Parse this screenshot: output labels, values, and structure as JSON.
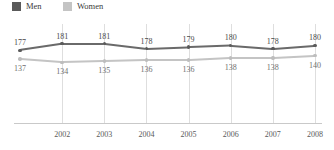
{
  "legend": {
    "items": [
      {
        "label": "Men",
        "color": "#5a5a5a",
        "swatch_name": "legend-swatch-men"
      },
      {
        "label": "Women",
        "color": "#c4c4c4",
        "swatch_name": "legend-swatch-women"
      }
    ]
  },
  "axis": {
    "tick_labels": [
      "2002",
      "2003",
      "2004",
      "2005",
      "2006",
      "2007",
      "2008"
    ],
    "line_color": "#c9c9c9",
    "grid_color": "#dedede"
  },
  "chart_data": {
    "type": "line",
    "title": "",
    "subtitle": "",
    "xlabel": "",
    "ylabel": "",
    "grid": true,
    "legend_position": "top-left",
    "categories": [
      "",
      "2002",
      "2003",
      "2004",
      "2005",
      "2006",
      "2007",
      "2008"
    ],
    "x_tick_labels": [
      "2002",
      "2003",
      "2004",
      "2005",
      "2006",
      "2007",
      "2008"
    ],
    "series": [
      {
        "name": "Men",
        "color": "#5a5a5a",
        "label_position": "above",
        "values": [
          177,
          181,
          181,
          178,
          179,
          180,
          178,
          180
        ]
      },
      {
        "name": "Women",
        "color": "#c4c4c4",
        "label_position": "below",
        "values": [
          137,
          134,
          135,
          136,
          136,
          138,
          138,
          140
        ]
      }
    ],
    "men_labels": [
      "177",
      "181",
      "181",
      "178",
      "179",
      "180",
      "178",
      "180"
    ],
    "women_labels": [
      "137",
      "134",
      "135",
      "136",
      "136",
      "138",
      "138",
      "140"
    ]
  }
}
